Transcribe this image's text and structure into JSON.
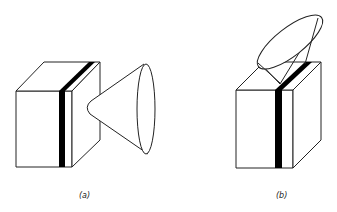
{
  "figures": [
    {
      "id": "a",
      "caption": "(a)",
      "description": "Box with vertical black stripe, cone attached horizontally on the right face"
    },
    {
      "id": "b",
      "caption": "(b)",
      "description": "Box with vertical black stripe, cone tilted upward attached on top face"
    }
  ],
  "colors": {
    "stroke": "#222222",
    "stripe": "#000000",
    "background": "#ffffff"
  }
}
